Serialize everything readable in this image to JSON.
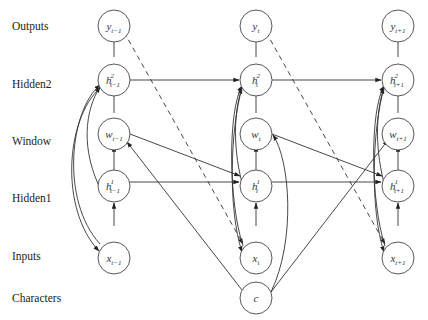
{
  "rows": [
    {
      "id": "outputs",
      "label": "Outputs",
      "y": 26
    },
    {
      "id": "hidden2",
      "label": "Hidden2",
      "y": 83
    },
    {
      "id": "window",
      "label": "Window",
      "y": 140
    },
    {
      "id": "hidden1",
      "label": "Hidden1",
      "y": 197
    },
    {
      "id": "inputs",
      "label": "Inputs",
      "y": 254
    },
    {
      "id": "characters",
      "label": "Characters",
      "y": 297
    }
  ],
  "columns": [
    {
      "id": "t-1",
      "x": 98,
      "nodes": {
        "y": {
          "base": "y",
          "sup": "",
          "sub": "t−1"
        },
        "h2": {
          "base": "h",
          "sup": "2",
          "sub": "t−1"
        },
        "w": {
          "base": "w",
          "sup": "",
          "sub": "t−1"
        },
        "h1": {
          "base": "h",
          "sup": "1",
          "sub": "t−1"
        },
        "x": {
          "base": "x",
          "sup": "",
          "sub": "t−1"
        }
      }
    },
    {
      "id": "t",
      "x": 256,
      "nodes": {
        "y": {
          "base": "y",
          "sup": "",
          "sub": "t"
        },
        "h2": {
          "base": "h",
          "sup": "2",
          "sub": "t"
        },
        "w": {
          "base": "w",
          "sup": "",
          "sub": "t"
        },
        "h1": {
          "base": "h",
          "sup": "1",
          "sub": "t"
        },
        "x": {
          "base": "x",
          "sup": "",
          "sub": "t"
        }
      }
    },
    {
      "id": "t+1",
      "x": 398,
      "nodes": {
        "y": {
          "base": "y",
          "sup": "",
          "sub": "t+1"
        },
        "h2": {
          "base": "h",
          "sup": "2",
          "sub": "t+1"
        },
        "w": {
          "base": "w",
          "sup": "",
          "sub": "t+1"
        },
        "h1": {
          "base": "h",
          "sup": "1",
          "sub": "t+1"
        },
        "x": {
          "base": "x",
          "sup": "",
          "sub": "t+1"
        }
      }
    }
  ],
  "characters_node": {
    "label": "c"
  },
  "labels": {
    "outputs": "Outputs",
    "hidden2": "Hidden2",
    "window": "Window",
    "hidden1": "Hidden1",
    "inputs": "Inputs",
    "characters": "Characters"
  }
}
